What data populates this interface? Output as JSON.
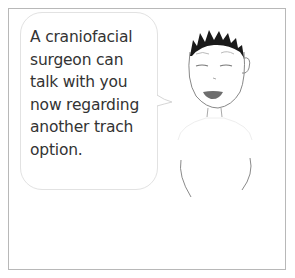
{
  "comic_panel": {
    "speech_bubble": {
      "text": "A craniofacial\nsurgeon can\ntalk with you\nnow regarding\nanother trach\noption."
    },
    "character": {
      "description": "person with spiky black hair, half-closed eyes, open mouth",
      "hair_color": "#1a1a1a",
      "mouth_color": "#6e6e6e",
      "line_color": "#888888"
    },
    "border_color": "#b8b8b8"
  }
}
